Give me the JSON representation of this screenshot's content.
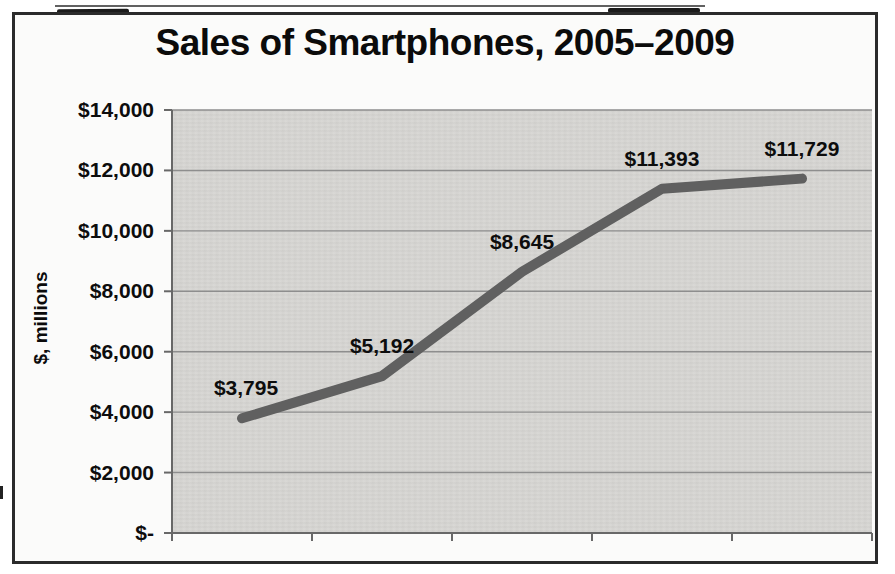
{
  "chart_data": {
    "type": "line",
    "title": "Sales of Smartphones, 2005–2009",
    "ylabel": "$, millions",
    "xlabel": "",
    "categories": [
      "2005",
      "2006",
      "2007",
      "2008",
      "2009"
    ],
    "values": [
      3795,
      5192,
      8645,
      11393,
      11729
    ],
    "data_labels": [
      "$3,795",
      "$5,192",
      "$8,645",
      "$11,393",
      "$11,729"
    ],
    "y_ticks": [
      {
        "value": 14000,
        "label": "$14,000"
      },
      {
        "value": 12000,
        "label": "$12,000"
      },
      {
        "value": 10000,
        "label": "$10,000"
      },
      {
        "value": 8000,
        "label": "$8,000"
      },
      {
        "value": 6000,
        "label": "$6,000"
      },
      {
        "value": 4000,
        "label": "$4,000"
      },
      {
        "value": 2000,
        "label": "$2,000"
      },
      {
        "value": 0,
        "label": "$-"
      }
    ],
    "ylim": [
      0,
      14000
    ],
    "x_axis_tick_labels_visible": false,
    "grid": true,
    "legend": "none",
    "colors": {
      "line": "#606060",
      "plot_background": "#d8d7d4",
      "gridline": "#8e8e8e",
      "axis": "#686868",
      "text": "#0d0d0d",
      "frame_border": "#2b2b2b"
    }
  }
}
